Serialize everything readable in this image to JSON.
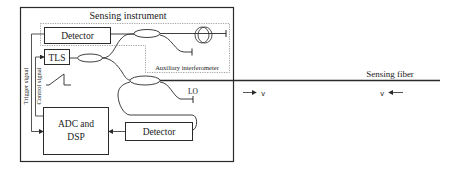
{
  "diagram": {
    "title": "Sensing instrument",
    "blocks": {
      "detector_top": "Detector",
      "tls": "TLS",
      "adc_line1": "ADC and",
      "adc_line2": "DSP",
      "detector_bottom": "Detector"
    },
    "labels": {
      "aux_interferometer": "Auxiliary interferometer",
      "lo": "LO",
      "sensing_fiber": "Sensing fiber",
      "trigger_signal": "Trigger signal",
      "control_signal": "Control signal",
      "v_forward": "v",
      "v_backward": "v"
    },
    "colors": {
      "line": "#2a2a2a",
      "dotted": "#8a8a8a",
      "background": "#ffffff"
    }
  }
}
